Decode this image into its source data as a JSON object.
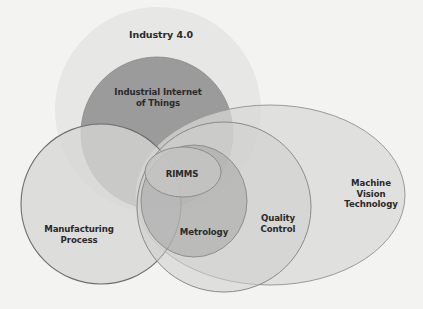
{
  "diagram": {
    "type": "venn",
    "colors": {
      "background": "#f3f3f1",
      "industry": "#e7e7e6",
      "iiot": "#9c9c9c",
      "manufacturing": "#d9d9d8",
      "machine_vision": "#dcdcdb",
      "quality_control": "#d3d3d2",
      "metrology": "#b0b0b0",
      "rimms": "#c6c6c5",
      "outline": "#7a7a7a",
      "text": "#2a2a2a"
    },
    "sets": [
      {
        "id": "industry-4-0",
        "lines": [
          "Industry 4.0"
        ]
      },
      {
        "id": "iiot",
        "lines": [
          "Industrial Internet",
          "of Things"
        ]
      },
      {
        "id": "manufacturing-process",
        "lines": [
          "Manufacturing",
          "Process"
        ]
      },
      {
        "id": "machine-vision-technology",
        "lines": [
          "Machine",
          "Vision",
          "Technology"
        ]
      },
      {
        "id": "quality-control",
        "lines": [
          "Quality",
          "Control"
        ]
      },
      {
        "id": "metrology",
        "lines": [
          "Metrology"
        ]
      },
      {
        "id": "rimms",
        "lines": [
          "RIMMS"
        ]
      }
    ]
  }
}
